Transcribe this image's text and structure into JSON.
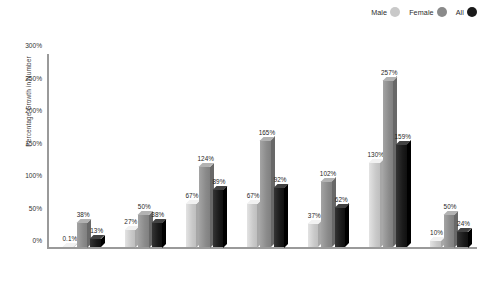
{
  "chart_data": {
    "type": "bar",
    "title": "",
    "subtitle": "",
    "xlabel": "",
    "ylabel": "Percentage Growth in Number",
    "ylim": [
      0,
      300
    ],
    "ytick_labels": [
      "0%",
      "50%",
      "100%",
      "150%",
      "200%",
      "250%",
      "300%"
    ],
    "ytick_values": [
      0,
      50,
      100,
      150,
      200,
      250,
      300
    ],
    "grid": false,
    "legend_position": "top-right",
    "categories": [
      "White",
      "African American",
      "Latino/a",
      "AA/PI",
      "AI/AN",
      "International",
      "Total"
    ],
    "series": [
      {
        "name": "Male",
        "color": "#c9c9c9",
        "values": [
          0.1,
          27,
          67,
          67,
          37,
          130,
          10
        ],
        "labels": [
          "0.1%",
          "27%",
          "67%",
          "67%",
          "37%",
          "130%",
          "10%"
        ]
      },
      {
        "name": "Female",
        "color": "#8a8a8a",
        "values": [
          38,
          50,
          124,
          165,
          102,
          257,
          50
        ],
        "labels": [
          "38%",
          "50%",
          "124%",
          "165%",
          "102%",
          "257%",
          "50%"
        ]
      },
      {
        "name": "All",
        "color": "#1a1a1a",
        "values": [
          13,
          38,
          89,
          92,
          62,
          159,
          24
        ],
        "labels": [
          "13%",
          "38%",
          "89%",
          "92%",
          "62%",
          "159%",
          "24%"
        ]
      }
    ]
  },
  "legend": {
    "items": [
      {
        "label": "Male",
        "color": "#c9c9c9"
      },
      {
        "label": "Female",
        "color": "#8a8a8a"
      },
      {
        "label": "All",
        "color": "#1a1a1a"
      }
    ]
  },
  "axes": {
    "y_title": "Percentage Growth in Number"
  },
  "colors": {
    "axis_line": "#9a9a9a",
    "background": "#ffffff",
    "text": "#2b2b2b"
  }
}
